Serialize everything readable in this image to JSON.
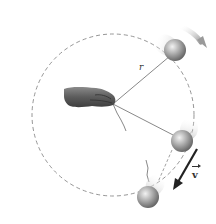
{
  "figure": {
    "labels": {
      "radius": "r",
      "velocity": "v"
    },
    "elements": {
      "path": "dashed circular path",
      "hand": "hand holding string at center",
      "balls": [
        "ball-top (blurred, moving)",
        "ball-right (blurred, moving)",
        "ball-released (flying off tangentially)"
      ],
      "motion_arrow": "curved direction-of-motion arrow",
      "velocity_vector": "tangential velocity vector"
    },
    "colors": {
      "background": "#ffffff",
      "path": "#8a8a8a",
      "string": "#6a6a6a",
      "ball": "#9a9a9a",
      "velocity_arrow": "#222222",
      "motion_arrow": "#b8b8b8"
    }
  }
}
